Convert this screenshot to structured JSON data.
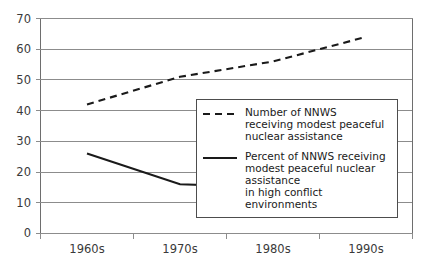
{
  "chart_data": {
    "type": "line",
    "title": "",
    "subtitle": "",
    "xlabel": "",
    "ylabel": "",
    "categories": [
      "1960s",
      "1970s",
      "1980s",
      "1990s"
    ],
    "ylim": [
      0,
      70
    ],
    "yticks": [
      0,
      10,
      20,
      30,
      40,
      50,
      60,
      70
    ],
    "ytick_labels": [
      "0",
      "10",
      "20",
      "30",
      "40",
      "50",
      "60",
      "70"
    ],
    "grid": true,
    "legend_position": "center-right inside plot area",
    "series": [
      {
        "name": "Number of NNWS receiving modest peaceful nuclear assistance",
        "style": "dashed",
        "color": "#1a1a1a",
        "values": [
          42,
          51,
          56,
          64
        ]
      },
      {
        "name": "Percent of NNWS receiving modest peaceful nuclear assistance in high conflict environments",
        "style": "solid",
        "color": "#1a1a1a",
        "values": [
          26,
          16,
          15,
          8
        ]
      }
    ]
  },
  "legend": {
    "entries": [
      {
        "swatch": "dashed-line-swatch",
        "label": "Number of NNWS\nreceiving modest peaceful\nnuclear assistance"
      },
      {
        "swatch": "solid-line-swatch",
        "label": "Percent of NNWS receiving\nmodest peaceful nuclear assistance\nin high conflict environments"
      }
    ]
  },
  "axes": {
    "y_tick_labels": [
      "70",
      "60",
      "50",
      "40",
      "30",
      "20",
      "10",
      "0"
    ],
    "x_tick_labels": [
      "1960s",
      "1970s",
      "1980s",
      "1990s"
    ]
  }
}
